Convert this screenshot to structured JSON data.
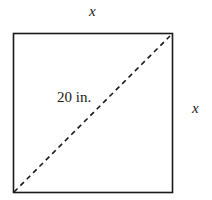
{
  "diagram": {
    "shape": "square",
    "top_side_label": "x",
    "right_side_label": "x",
    "diagonal_label": "20 in.",
    "diagonal_style": "dashed",
    "colors": {
      "stroke": "#1a1a1a",
      "background": "#ffffff"
    }
  }
}
